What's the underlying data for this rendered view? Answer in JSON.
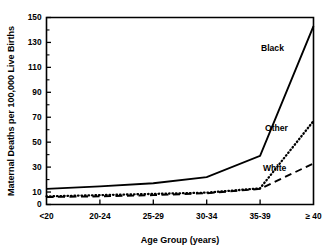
{
  "chart_data": {
    "type": "line",
    "title": "",
    "xlabel": "Age Group (years)",
    "ylabel": "Maternal Deaths per 100,000 Live Births",
    "categories": [
      "<20",
      "20-24",
      "25-29",
      "30-34",
      "35-39",
      "≥ 40"
    ],
    "ylim": [
      0,
      150
    ],
    "yticks": [
      0,
      10,
      30,
      50,
      70,
      90,
      110,
      130,
      150
    ],
    "ytick_labels": [
      "0",
      "10",
      "30",
      "50",
      "70",
      "90",
      "110",
      "130",
      "150"
    ],
    "yticks_minor": [
      20,
      40,
      60,
      80,
      100,
      120,
      140
    ],
    "grid": false,
    "legend_position": "inline-labels",
    "series": [
      {
        "name": "Black",
        "style": "solid",
        "color": "#000000",
        "values": [
          12.5,
          14.5,
          17,
          22,
          39,
          143
        ]
      },
      {
        "name": "Other",
        "style": "dotted",
        "color": "#000000",
        "values": [
          6.5,
          7.5,
          8.5,
          9.5,
          13,
          67
        ]
      },
      {
        "name": "White",
        "style": "dashed",
        "color": "#000000",
        "values": [
          6,
          6.5,
          7.5,
          9,
          12.5,
          33
        ]
      }
    ],
    "annotations": [
      {
        "text": "Black",
        "series": "Black"
      },
      {
        "text": "Other",
        "series": "Other"
      },
      {
        "text": "White",
        "series": "White"
      }
    ]
  }
}
